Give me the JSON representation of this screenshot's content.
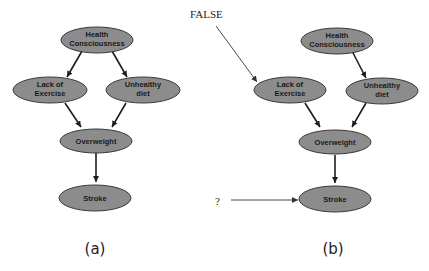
{
  "diagrams": [
    {
      "id": "a",
      "caption": "(a)",
      "nodes": {
        "health": [
          "Health",
          "Consciousness"
        ],
        "lack": [
          "Lack of",
          "Exercise"
        ],
        "diet": [
          "Unhealthy",
          "diet"
        ],
        "overweight": [
          "Overweight"
        ],
        "stroke": [
          "Stroke"
        ]
      },
      "edges": [
        [
          "Health Consciousness",
          "Lack of Exercise"
        ],
        [
          "Health Consciousness",
          "Unhealthy diet"
        ],
        [
          "Lack of Exercise",
          "Overweight"
        ],
        [
          "Unhealthy diet",
          "Overweight"
        ],
        [
          "Overweight",
          "Stroke"
        ]
      ]
    },
    {
      "id": "b",
      "caption": "(b)",
      "nodes": {
        "health": [
          "Health",
          "Consciousness"
        ],
        "lack": [
          "Lack of",
          "Exercise"
        ],
        "diet": [
          "Unhealthy",
          "diet"
        ],
        "overweight": [
          "Overweight"
        ],
        "stroke": [
          "Stroke"
        ]
      },
      "edges": [
        [
          "Health Consciousness",
          "Unhealthy diet"
        ],
        [
          "Lack of Exercise",
          "Overweight"
        ],
        [
          "Unhealthy diet",
          "Overweight"
        ],
        [
          "Overweight",
          "Stroke"
        ]
      ],
      "annotations": {
        "intervention_label": "FALSE",
        "query_label": "?"
      }
    }
  ],
  "colors": {
    "node_fill": "#8c8c8c",
    "node_stroke": "#3a3a3a",
    "edge": "#1e1e1e"
  }
}
